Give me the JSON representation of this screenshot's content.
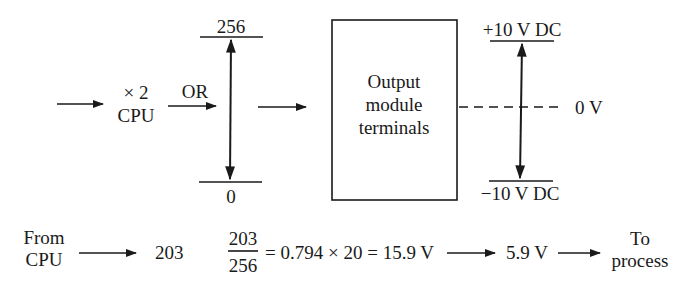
{
  "colors": {
    "ink": "#1a1a1a",
    "background": "#ffffff"
  },
  "top_row": {
    "cpu_block": {
      "line1": "× 2",
      "line2": "CPU"
    },
    "or_label": "OR",
    "digital_scale": {
      "max": "256",
      "min": "0"
    },
    "output_module": {
      "line1": "Output",
      "line2": "module",
      "line3": "terminals"
    },
    "analog_scale": {
      "max": "+10 V DC",
      "zero": "0 V",
      "min": "−10 V DC"
    }
  },
  "bottom_row": {
    "source": {
      "line1": "From",
      "line2": "CPU"
    },
    "value": "203",
    "fraction": {
      "numerator": "203",
      "denominator": "256"
    },
    "equation": "= 0.794 × 20 = 15.9 V",
    "result": "5.9 V",
    "destination": {
      "line1": "To",
      "line2": "process"
    }
  }
}
